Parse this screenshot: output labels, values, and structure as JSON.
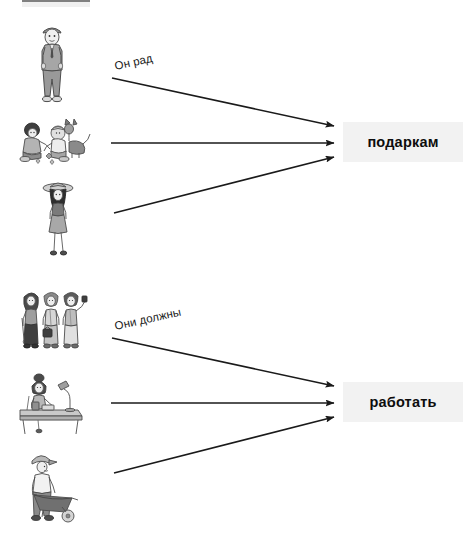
{
  "worksheet": {
    "top_band": "decorative-gray-band",
    "groups": [
      {
        "id": "group-gifts",
        "caption": "Он рад",
        "target_word": "подаркам",
        "illustrations": [
          {
            "name": "man-in-suit-standing",
            "alt": "Мужчина в костюме"
          },
          {
            "name": "children-with-dog",
            "alt": "Дети с собакой"
          },
          {
            "name": "woman-in-hat-walking",
            "alt": "Женщина в шляпе"
          }
        ]
      },
      {
        "id": "group-work",
        "caption": "Они должны",
        "target_word": "работать",
        "illustrations": [
          {
            "name": "group-of-three-people",
            "alt": "Группа из трёх людей"
          },
          {
            "name": "woman-at-desk-with-lamp",
            "alt": "Женщина за столом с лампой"
          },
          {
            "name": "person-with-wheelbarrow",
            "alt": "Человек с тачкой"
          }
        ]
      }
    ],
    "colors": {
      "arrow": "#1a1a1a",
      "target_bg": "#f2f2f2",
      "text": "#0d0d0d",
      "band": "#f0f0f0"
    }
  }
}
